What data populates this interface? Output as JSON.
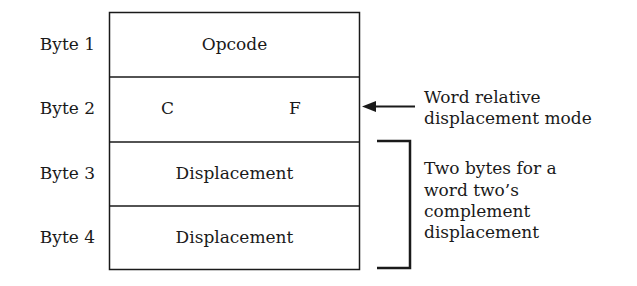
{
  "diagram": {
    "rows": [
      {
        "label": "Byte 1",
        "content": "Opcode"
      },
      {
        "label": "Byte 2",
        "content_left": "C",
        "content_right": "F"
      },
      {
        "label": "Byte 3",
        "content": "Displacement"
      },
      {
        "label": "Byte 4",
        "content": "Displacement"
      }
    ],
    "annotations": {
      "arrow_note_line1": "Word relative",
      "arrow_note_line2": "displacement mode",
      "bracket_note_line1": "Two bytes for a",
      "bracket_note_line2": "word two’s",
      "bracket_note_line3": "complement",
      "bracket_note_line4": "displacement"
    },
    "colors": {
      "line": "#1a1a1a",
      "background": "#ffffff"
    }
  }
}
